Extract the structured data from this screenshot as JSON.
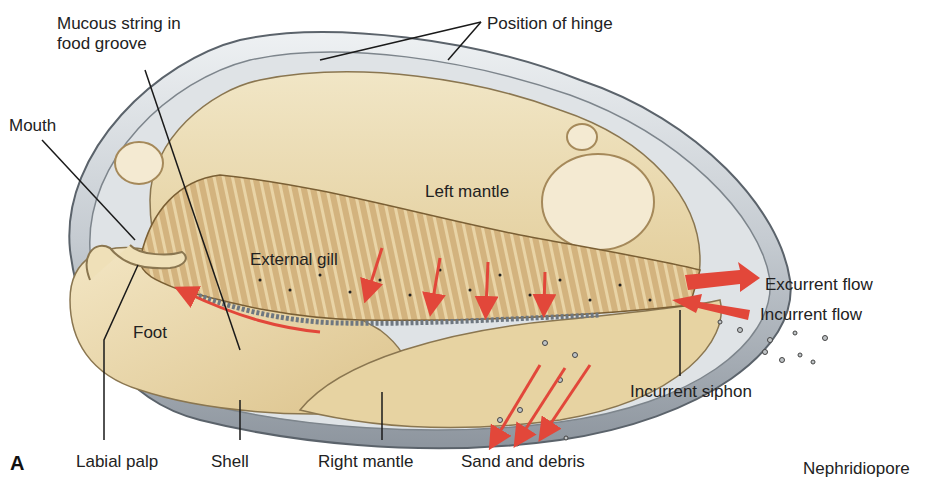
{
  "figure": {
    "panel_letter": "A",
    "labels": {
      "mucous_string": "Mucous string in\nfood groove",
      "position_of_hinge": "Position of hinge",
      "mouth": "Mouth",
      "left_mantle": "Left mantle",
      "external_gill": "External gill",
      "foot": "Foot",
      "excurrent_flow": "Excurrent flow",
      "incurrent_flow": "Incurrent flow",
      "incurrent_siphon": "Incurrent siphon",
      "labial_palp": "Labial palp",
      "shell": "Shell",
      "right_mantle": "Right mantle",
      "sand_and_debris": "Sand and debris",
      "nephridiopore": "Nephridiopore"
    },
    "colors": {
      "flow_arrow": "#e2473a",
      "mantle": "#ecdcb2",
      "gill": "#cfae78",
      "shell": "#c9ced3",
      "leader_line": "#1a1a1a"
    }
  }
}
